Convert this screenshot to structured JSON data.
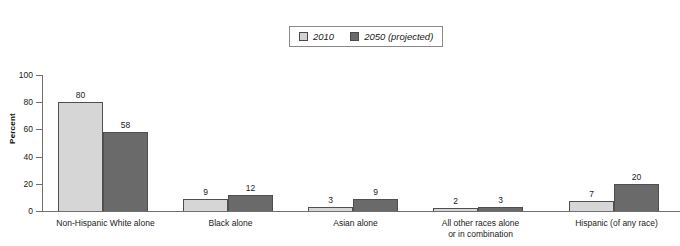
{
  "chart_data": {
    "type": "bar",
    "title": "",
    "subtitle": "",
    "xlabel": "",
    "ylabel": "Percent",
    "ylim": [
      0,
      100
    ],
    "yticks": [
      0,
      20,
      40,
      60,
      80,
      100
    ],
    "ytick_labels": [
      "0",
      "20",
      "40",
      "60",
      "80",
      "100"
    ],
    "grid": false,
    "legend_position": "top-center",
    "categories": [
      "Non-Hispanic White alone",
      "Black alone",
      "Asian alone",
      "All other races alone or in combination",
      "Hispanic (of any race)"
    ],
    "category_lines": [
      [
        "Non-Hispanic White alone"
      ],
      [
        "Black alone"
      ],
      [
        "Asian alone"
      ],
      [
        "All other races alone",
        "or in combination"
      ],
      [
        "Hispanic (of any race)"
      ]
    ],
    "series": [
      {
        "name": "2010",
        "color": "#d6d6d6",
        "values": [
          80,
          9,
          3,
          2,
          7
        ],
        "value_labels": [
          "80",
          "9",
          "3",
          "2",
          "7"
        ]
      },
      {
        "name": "2050 (projected)",
        "color": "#6a6a6a",
        "values": [
          58,
          12,
          9,
          3,
          20
        ],
        "value_labels": [
          "58",
          "12",
          "9",
          "3",
          "20"
        ]
      }
    ]
  },
  "legend": {
    "entries": [
      {
        "label": "2010",
        "color": "#d6d6d6"
      },
      {
        "label": "2050 (projected)",
        "color": "#6a6a6a"
      }
    ]
  },
  "axes": {
    "y_title": "Percent",
    "y_tick_labels": [
      "100",
      "80",
      "60",
      "40",
      "20",
      "0"
    ]
  },
  "colors": {
    "series_2010": "#d6d6d6",
    "series_2050": "#6a6a6a",
    "axis": "#6f6f6f",
    "text": "#1a1a1a",
    "background": "#ffffff"
  }
}
